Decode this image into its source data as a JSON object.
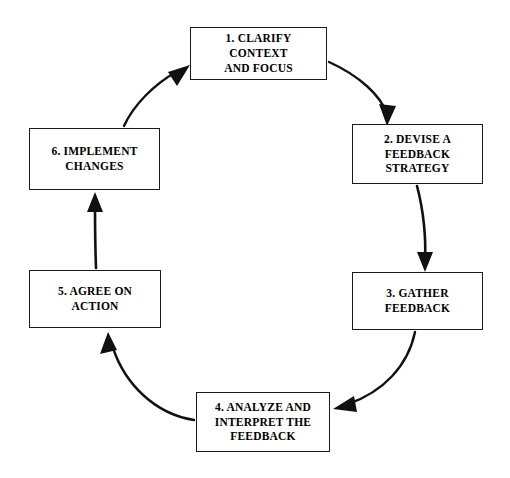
{
  "diagram": {
    "type": "cyclical-process-diagram",
    "direction": "clockwise",
    "background_color": "#ffffff",
    "stroke_color": "#1a1a1a",
    "text_color": "#000000",
    "nodes": [
      {
        "id": "node-1",
        "number": "1.",
        "label": "1. CLARIFY CONTEXT\nAND FOCUS"
      },
      {
        "id": "node-2",
        "number": "2.",
        "label": "2. DEVISE A\nFEEDBACK\nSTRATEGY"
      },
      {
        "id": "node-3",
        "number": "3.",
        "label": "3. GATHER\nFEEDBACK"
      },
      {
        "id": "node-4",
        "number": "4.",
        "label": "4. ANALYZE AND\nINTERPRET THE\nFEEDBACK"
      },
      {
        "id": "node-5",
        "number": "5.",
        "label": "5. AGREE ON\nACTION"
      },
      {
        "id": "node-6",
        "number": "6.",
        "label": "6. IMPLEMENT\nCHANGES"
      }
    ],
    "connectors": [
      {
        "id": "arrow-1-2",
        "from": "node-1",
        "to": "node-2",
        "style": "curved"
      },
      {
        "id": "arrow-2-3",
        "from": "node-2",
        "to": "node-3",
        "style": "straight"
      },
      {
        "id": "arrow-3-4",
        "from": "node-3",
        "to": "node-4",
        "style": "curved"
      },
      {
        "id": "arrow-4-5",
        "from": "node-4",
        "to": "node-5",
        "style": "curved"
      },
      {
        "id": "arrow-5-6",
        "from": "node-5",
        "to": "node-6",
        "style": "straight"
      },
      {
        "id": "arrow-6-1",
        "from": "node-6",
        "to": "node-1",
        "style": "curved"
      }
    ]
  }
}
